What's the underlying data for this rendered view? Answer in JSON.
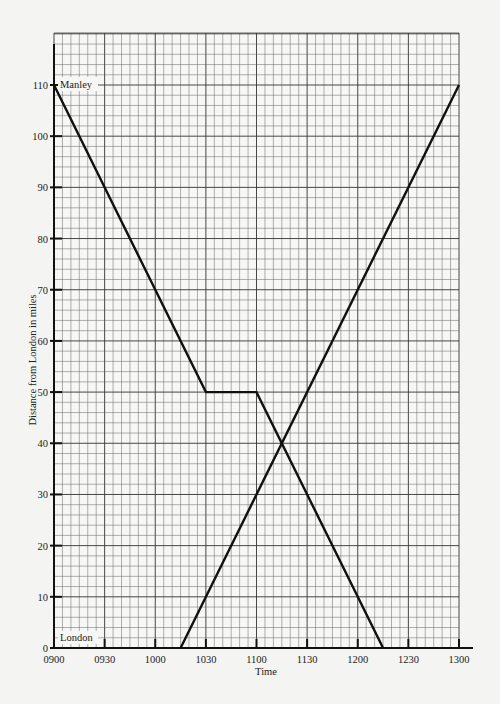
{
  "chart_data": {
    "type": "line",
    "title": "",
    "xlabel": "Time",
    "ylabel": "Distance from London in miles",
    "x_tick_labels": [
      "0900",
      "0930",
      "1000",
      "1030",
      "1100",
      "1130",
      "1200",
      "1230",
      "1300"
    ],
    "y_tick_labels": [
      "0",
      "10",
      "20",
      "30",
      "40",
      "50",
      "60",
      "70",
      "80",
      "90",
      "100",
      "110"
    ],
    "xlim_hours": [
      9.0,
      13.0
    ],
    "ylim": [
      0,
      110
    ],
    "grid": true,
    "annotations": [
      {
        "text": "Manley",
        "x_hours": 9.0,
        "y": 110
      },
      {
        "text": "London",
        "x_hours": 9.0,
        "y": 0
      }
    ],
    "series": [
      {
        "name": "Journey from Manley to London",
        "points": [
          {
            "time": "0900",
            "x_hours": 9.0,
            "y": 110
          },
          {
            "time": "1030",
            "x_hours": 10.5,
            "y": 50
          },
          {
            "time": "1100",
            "x_hours": 11.0,
            "y": 50
          },
          {
            "time": "1215",
            "x_hours": 12.25,
            "y": 0
          }
        ]
      },
      {
        "name": "Journey from London to Manley",
        "points": [
          {
            "time": "1015",
            "x_hours": 10.25,
            "y": 0
          },
          {
            "time": "1300",
            "x_hours": 13.0,
            "y": 110
          }
        ]
      }
    ],
    "intersection": {
      "time": "1115",
      "x_hours": 11.25,
      "y": 40
    }
  },
  "labels": {
    "manley": "Manley",
    "london": "London",
    "xlabel": "Time",
    "ylabel": "Distance from London in miles"
  }
}
